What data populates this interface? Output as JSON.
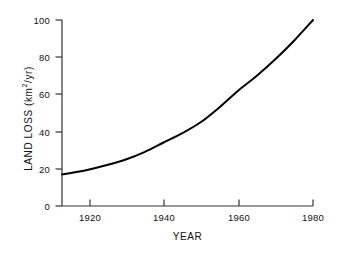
{
  "chart_data": {
    "type": "line",
    "title": "",
    "xlabel": "YEAR",
    "ylabel": "LAND LOSS (km2/yr)",
    "ylabel_parts": {
      "prefix": "LAND LOSS (km",
      "exponent": "2",
      "suffix": "/yr)"
    },
    "xlim": [
      1913,
      1980
    ],
    "ylim": [
      0,
      100
    ],
    "grid": false,
    "legend": null,
    "xticks": [
      1920,
      1940,
      1960,
      1980
    ],
    "xtick_labels": [
      "1920",
      "1940",
      "1960",
      "1980"
    ],
    "yticks": [
      0,
      20,
      40,
      60,
      80,
      100
    ],
    "ytick_labels": [
      "0",
      "20",
      "40",
      "60",
      "80",
      "100"
    ],
    "series": [
      {
        "name": "Land loss rate",
        "color": "#000000",
        "linewidth": 2,
        "x": [
          1913,
          1915,
          1920,
          1925,
          1930,
          1935,
          1940,
          1945,
          1950,
          1955,
          1960,
          1965,
          1970,
          1975,
          1980
        ],
        "y": [
          17,
          17.6,
          19.5,
          22,
          25,
          29,
          34,
          39,
          45,
          53,
          62,
          70,
          79,
          89,
          100
        ]
      }
    ],
    "annotations": []
  },
  "axes": {
    "spines": {
      "left": true,
      "bottom": true,
      "top": false,
      "right": false
    },
    "axis_color": "#333333",
    "background": "#ffffff"
  }
}
